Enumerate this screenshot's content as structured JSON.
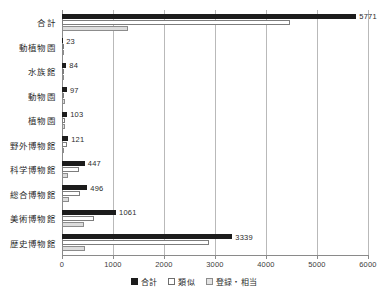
{
  "chart_data": {
    "type": "bar",
    "orientation": "horizontal",
    "title": "",
    "xlabel": "",
    "ylabel": "",
    "xlim": [
      0,
      6000
    ],
    "xticks": [
      0,
      1000,
      2000,
      3000,
      4000,
      5000,
      6000
    ],
    "xtick_labels": [
      "0",
      "1000",
      "2000",
      "3000",
      "4000",
      "5000",
      "6000"
    ],
    "grid": true,
    "legend_position": "bottom-center",
    "categories": [
      "合計",
      "動植物園",
      "水族館",
      "動物園",
      "植物園",
      "野外博物館",
      "科学博物館",
      "総合博物館",
      "美術博物館",
      "歴史博物館"
    ],
    "series": [
      {
        "name": "合計",
        "color": "#1c1c1c",
        "values": [
          5771,
          23,
          84,
          97,
          103,
          121,
          447,
          496,
          1061,
          3339
        ],
        "labels": [
          "5771",
          "23",
          "84",
          "97",
          "103",
          "121",
          "447",
          "496",
          "1061",
          "3339"
        ]
      },
      {
        "name": "類似",
        "color": "#ffffff",
        "values": [
          4480,
          15,
          40,
          45,
          50,
          95,
          330,
          350,
          620,
          2880
        ],
        "labels": [
          "",
          "",
          "",
          "",
          "",
          "",
          "",
          "",
          "",
          ""
        ]
      },
      {
        "name": "登録・相当",
        "color": "#dcdcdc",
        "values": [
          1291,
          8,
          44,
          52,
          53,
          26,
          117,
          146,
          441,
          459
        ],
        "labels": [
          "",
          "",
          "",
          "",
          "",
          "",
          "",
          "",
          "",
          ""
        ]
      }
    ]
  },
  "legend": {
    "items": [
      {
        "label": "合計"
      },
      {
        "label": "類似"
      },
      {
        "label": "登録・相当"
      }
    ]
  }
}
